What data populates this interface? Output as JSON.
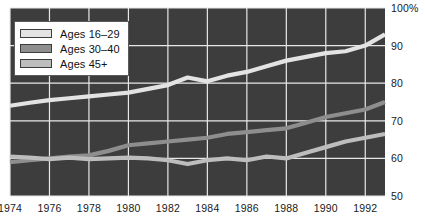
{
  "chart_data": {
    "type": "line",
    "title": "",
    "subtitle": "",
    "xlabel": "",
    "ylabel": "",
    "xlim": [
      1974,
      1993
    ],
    "ylim": [
      50,
      100
    ],
    "grid": true,
    "legend_position": "top-left",
    "background_color": "#3d3d3d",
    "grid_color": "#e8e8e8",
    "x_ticks": [
      "1974",
      "1976",
      "1978",
      "1980",
      "1982",
      "1984",
      "1986",
      "1988",
      "1990",
      "1992"
    ],
    "x_tick_values": [
      1974,
      1976,
      1978,
      1980,
      1982,
      1984,
      1986,
      1988,
      1990,
      1992
    ],
    "y_ticks": [
      "100%",
      "90",
      "80",
      "70",
      "60",
      "50"
    ],
    "y_tick_values": [
      100,
      90,
      80,
      70,
      60,
      50
    ],
    "x": [
      1974,
      1975,
      1976,
      1977,
      1978,
      1979,
      1980,
      1981,
      1982,
      1983,
      1984,
      1985,
      1986,
      1987,
      1988,
      1989,
      1990,
      1991,
      1992,
      1993
    ],
    "series": [
      {
        "name": "Ages 16–29",
        "color": "#e3e3e3",
        "values": [
          74.0,
          74.8,
          75.5,
          76.0,
          76.5,
          77.0,
          77.5,
          78.5,
          79.5,
          81.5,
          80.5,
          82.0,
          83.0,
          84.5,
          86.0,
          87.0,
          88.0,
          88.5,
          90.0,
          93.0
        ]
      },
      {
        "name": "Ages 30–40",
        "color": "#8e8e8e",
        "values": [
          59.0,
          59.5,
          60.0,
          60.5,
          60.8,
          62.0,
          63.5,
          64.0,
          64.5,
          65.0,
          65.5,
          66.5,
          67.0,
          67.5,
          68.0,
          69.5,
          71.0,
          72.0,
          73.0,
          75.0
        ]
      },
      {
        "name": "Ages 45+",
        "color": "#bdbdbd",
        "values": [
          60.5,
          60.2,
          59.8,
          60.2,
          59.8,
          60.0,
          60.2,
          60.0,
          59.5,
          58.5,
          59.5,
          60.0,
          59.5,
          60.5,
          60.0,
          61.5,
          63.0,
          64.5,
          65.5,
          66.5
        ]
      }
    ]
  },
  "legend": {
    "items": [
      {
        "label": "Ages 16–29",
        "color": "#e3e3e3"
      },
      {
        "label": "Ages 30–40",
        "color": "#8e8e8e"
      },
      {
        "label": "Ages 45+",
        "color": "#bdbdbd"
      }
    ]
  }
}
